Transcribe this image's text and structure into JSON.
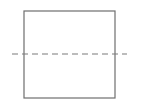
{
  "diagram": {
    "type": "square-with-dashed-line",
    "square": {
      "x": 24,
      "y": 11,
      "width": 91,
      "height": 87,
      "stroke": "#6e6e6e",
      "stroke_width": 1.2
    },
    "dashed_line": {
      "x1": 12,
      "y1": 54,
      "x2": 127,
      "y2": 54,
      "stroke": "#7a7a7a",
      "stroke_width": 1.2,
      "dash": "6,4"
    }
  }
}
